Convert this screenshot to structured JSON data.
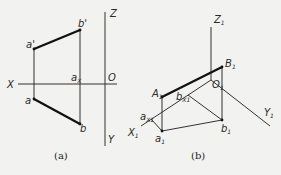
{
  "figure_a": {
    "caption": "(a)",
    "labels": {
      "X": "X",
      "Z": "Z",
      "Y": "Y",
      "O": "O",
      "a_prime": "a'",
      "b_prime": "b'",
      "a": "a",
      "b": "b",
      "ax_main": "a",
      "ax_sub": "X"
    }
  },
  "figure_b": {
    "caption": "(b)",
    "labels": {
      "Z1_main": "Z",
      "Z1_sub": "1",
      "B1_main": "B",
      "B1_sub": "1",
      "O1_main": "O",
      "O1_sub": "1",
      "A1_main": "A",
      "A1_sub": "1",
      "bx1_main": "b",
      "bx1_sub": "X1",
      "ax1_main": "a",
      "ax1_sub": "X1",
      "X1_main": "X",
      "X1_sub": "1",
      "Y1_main": "Y",
      "Y1_sub": "1",
      "a1_main": "a",
      "a1_sub": "1",
      "b1_main": "b",
      "b1_sub": "1"
    }
  }
}
